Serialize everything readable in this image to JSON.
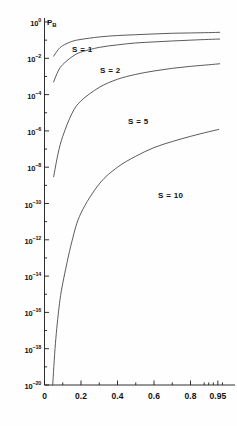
{
  "chart_data": {
    "type": "line",
    "title": "",
    "ylabel": "P_B",
    "xlabel": "",
    "yscale": "log",
    "ylim": [
      1e-20,
      1
    ],
    "xlim": [
      0,
      1
    ],
    "grid": false,
    "legend_position": "inline-curve-labels",
    "y_tick_labels": [
      "10^0",
      "10^-2",
      "10^-4",
      "10^-6",
      "10^-8",
      "10^-10",
      "10^-12",
      "10^-14",
      "10^-16",
      "10^-18",
      "10^-20"
    ],
    "y_tick_exponents": [
      0,
      -2,
      -4,
      -6,
      -8,
      -10,
      -12,
      -14,
      -16,
      -18,
      -20
    ],
    "x_tick_labels": [
      "0",
      "0.2",
      "0.4",
      "0.6",
      "0.8",
      "0.95"
    ],
    "x_tick_values": [
      0,
      0.2,
      0.4,
      0.6,
      0.8,
      0.95
    ],
    "series": [
      {
        "name": "S = 1",
        "label": "S = 1",
        "x": [
          0.05,
          0.075,
          0.1,
          0.15,
          0.2,
          0.3,
          0.4,
          0.5,
          0.6,
          0.7,
          0.8,
          0.9,
          0.96
        ],
        "values": [
          0.013,
          0.03,
          0.05,
          0.085,
          0.11,
          0.15,
          0.18,
          0.2,
          0.22,
          0.24,
          0.25,
          0.26,
          0.27
        ]
      },
      {
        "name": "S = 2",
        "label": "S = 2",
        "x": [
          0.05,
          0.075,
          0.1,
          0.15,
          0.2,
          0.3,
          0.4,
          0.5,
          0.6,
          0.7,
          0.8,
          0.9,
          0.96
        ],
        "values": [
          0.0005,
          0.002,
          0.0045,
          0.012,
          0.022,
          0.04,
          0.055,
          0.07,
          0.08,
          0.09,
          0.1,
          0.11,
          0.115
        ]
      },
      {
        "name": "S = 5",
        "label": "S = 5",
        "x": [
          0.05,
          0.075,
          0.1,
          0.15,
          0.2,
          0.3,
          0.4,
          0.5,
          0.6,
          0.7,
          0.8,
          0.9,
          0.96
        ],
        "values": [
          3e-09,
          6e-08,
          5e-07,
          9e-06,
          4.5e-05,
          0.00025,
          0.0007,
          0.0013,
          0.002,
          0.0028,
          0.0036,
          0.0044,
          0.005
        ]
      },
      {
        "name": "S = 10",
        "label": "S = 10",
        "x": [
          0.045,
          0.06,
          0.08,
          0.1,
          0.15,
          0.2,
          0.3,
          0.4,
          0.5,
          0.6,
          0.7,
          0.8,
          0.9,
          0.955
        ],
        "values": [
          1e-20,
          2e-18,
          2e-16,
          4e-15,
          8e-13,
          3e-11,
          1.2e-09,
          1e-08,
          4e-08,
          1.2e-07,
          2.6e-07,
          5e-07,
          9e-07,
          1.2e-06
        ]
      }
    ]
  },
  "style": {
    "curve_color": "#3d3d3d",
    "axis_color": "#1a1a1a",
    "background": "#fefefe"
  }
}
